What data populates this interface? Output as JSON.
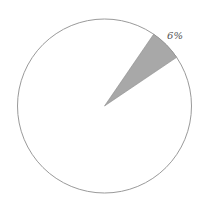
{
  "chart_data": {
    "type": "pie",
    "title": "",
    "slices": [
      {
        "label": "6%",
        "value": 6,
        "color": "#a8a8a8"
      },
      {
        "label": "",
        "value": 94,
        "color": "#ffffff"
      }
    ],
    "start_angle_deg": 34,
    "outline_color": "#9a9a9a",
    "legend": "none"
  }
}
